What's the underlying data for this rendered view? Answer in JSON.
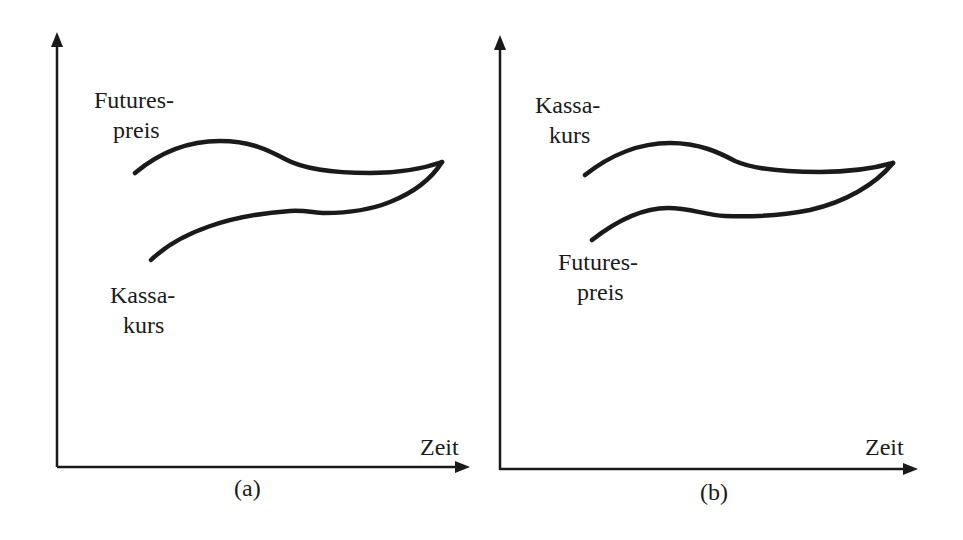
{
  "panels": [
    {
      "id": "a",
      "caption": "(a)",
      "x_axis_label": "Zeit",
      "upper_label_line1": "Futures-",
      "upper_label_line2": "preis",
      "lower_label_line1": "Kassa-",
      "lower_label_line2": "kurs",
      "description": "Futurespreis above Kassakurs, converging at expiry"
    },
    {
      "id": "b",
      "caption": "(b)",
      "x_axis_label": "Zeit",
      "upper_label_line1": "Kassa-",
      "upper_label_line2": "kurs",
      "lower_label_line1": "Futures-",
      "lower_label_line2": "preis",
      "description": "Kassakurs above Futurespreis, converging at expiry"
    }
  ],
  "colors": {
    "ink": "#1a1a1a",
    "background": "#ffffff"
  }
}
